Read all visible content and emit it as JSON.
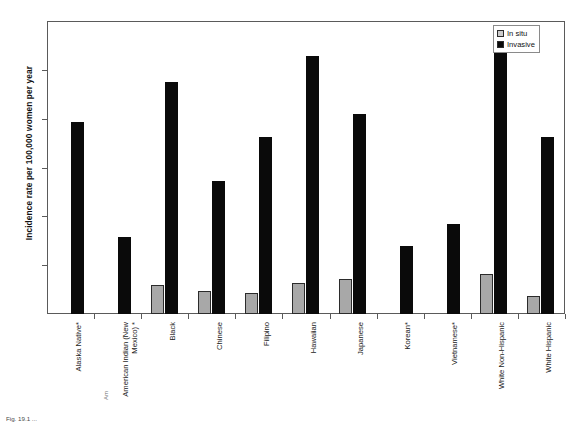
{
  "chart_data": {
    "type": "bar",
    "title": "",
    "xlabel": "",
    "ylabel": "Incidence rate per 100,000 women per year",
    "ylim": [
      0,
      120
    ],
    "yticks": [
      0,
      20,
      40,
      60,
      80,
      100,
      120
    ],
    "grid": false,
    "legend_position": "top-right",
    "categories": [
      "Alaska Native*",
      "American Indian (New Mexico) *",
      "Black",
      "Chinese",
      "Filipino",
      "Hawaiian",
      "Japanese",
      "Korean*",
      "Vietnamese*",
      "White Non-Hispanic",
      "White Hispanic"
    ],
    "series": [
      {
        "name": "In situ",
        "color": "#a8a8a8",
        "values": [
          0,
          0,
          12,
          9.5,
          8.5,
          12.5,
          14.5,
          0,
          0,
          16.5,
          7.5
        ]
      },
      {
        "name": "Invasive",
        "color": "#0a0a0a",
        "values": [
          78.7,
          31.6,
          95,
          54.5,
          72.5,
          105.5,
          82,
          28,
          36.8,
          115.5,
          72.5
        ]
      }
    ]
  },
  "legend": {
    "items": [
      {
        "label": "In situ",
        "swatch": "insitu"
      },
      {
        "label": "Invasive",
        "swatch": "invasive"
      }
    ]
  },
  "caption": {
    "text": "Fig. 19.1 ...",
    "cut_marker": "Am"
  }
}
